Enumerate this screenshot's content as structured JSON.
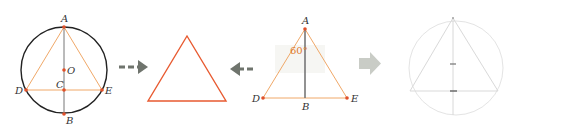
{
  "colors": {
    "circle": "#222222",
    "triangle_light": "#f0a868",
    "triangle_bold": "#e85a30",
    "axis": "#777777",
    "point": "#e0502a",
    "arrow": "#6f746d",
    "arrow_solid": "#c9ccc6",
    "faint": "#dcdcdc",
    "label": "#333333",
    "angle_label": "#e07a2e"
  },
  "panel1": {
    "labels": {
      "A": "A",
      "B": "B",
      "C": "C",
      "D": "D",
      "E": "E",
      "O": "O"
    }
  },
  "panel3": {
    "labels": {
      "A": "A",
      "B": "B",
      "D": "D",
      "E": "E"
    },
    "angle": "60°"
  },
  "arrows": [
    {
      "direction": "right",
      "style": "dashed"
    },
    {
      "direction": "left",
      "style": "dashed"
    },
    {
      "direction": "right",
      "style": "solid-block"
    }
  ]
}
